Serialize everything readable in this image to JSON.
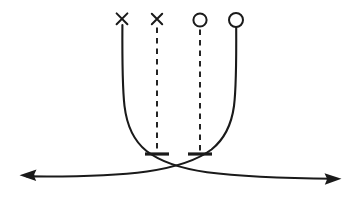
{
  "figure": {
    "kind": "asymptote-diagram",
    "title": "",
    "background_color": "#ffffff",
    "stroke_color": "#1a1a1a",
    "width": 359,
    "height": 197
  },
  "chart_data": {
    "type": "line",
    "title": "",
    "xlabel": "",
    "ylabel": "",
    "grid": false,
    "legend": null,
    "xlim": [
      0,
      359
    ],
    "ylim": [
      197,
      0
    ],
    "annotations": [
      {
        "name": "endpoint-open-left-curve",
        "marker": "cross",
        "x": 122,
        "y": 19,
        "label": "×"
      },
      {
        "name": "endpoint-open-left-dashed",
        "marker": "cross",
        "x": 157,
        "y": 19,
        "label": "×"
      },
      {
        "name": "endpoint-open-right-dashed",
        "marker": "circle",
        "x": 200,
        "y": 20,
        "label": "○"
      },
      {
        "name": "endpoint-open-right-curve",
        "marker": "circle",
        "x": 236,
        "y": 20,
        "label": "○"
      }
    ],
    "series": [
      {
        "name": "left-asymptotic-branch",
        "style": "solid",
        "arrow": "end",
        "points": [
          [
            122,
            25
          ],
          [
            122,
            60
          ],
          [
            123,
            95
          ],
          [
            128,
            125
          ],
          [
            142,
            148
          ],
          [
            165,
            163
          ],
          [
            200,
            172
          ],
          [
            250,
            176
          ],
          [
            300,
            178
          ],
          [
            340,
            179
          ]
        ]
      },
      {
        "name": "right-asymptotic-branch",
        "style": "solid",
        "arrow": "start",
        "points": [
          [
            236,
            27
          ],
          [
            236,
            62
          ],
          [
            235,
            97
          ],
          [
            231,
            122
          ],
          [
            219,
            143
          ],
          [
            198,
            158
          ],
          [
            168,
            168
          ],
          [
            120,
            174
          ],
          [
            70,
            176
          ],
          [
            22,
            176
          ]
        ]
      },
      {
        "name": "left-dashed-drop-line",
        "style": "dashed",
        "arrow": "none",
        "points": [
          [
            157,
            27
          ],
          [
            157,
            152
          ]
        ]
      },
      {
        "name": "right-dashed-drop-line",
        "style": "dashed",
        "arrow": "none",
        "points": [
          [
            200,
            29
          ],
          [
            200,
            152
          ]
        ]
      }
    ],
    "terminators": [
      {
        "name": "left-dashed-tick",
        "type": "t-bar",
        "x": 157,
        "y": 154,
        "half_width": 12
      },
      {
        "name": "right-dashed-tick",
        "type": "t-bar",
        "x": 200,
        "y": 154,
        "half_width": 12
      }
    ],
    "arrowheads": [
      {
        "name": "left-arrowhead",
        "x": 20,
        "y": 175,
        "direction": "left"
      },
      {
        "name": "right-arrowhead",
        "x": 341,
        "y": 179,
        "direction": "right"
      }
    ]
  }
}
